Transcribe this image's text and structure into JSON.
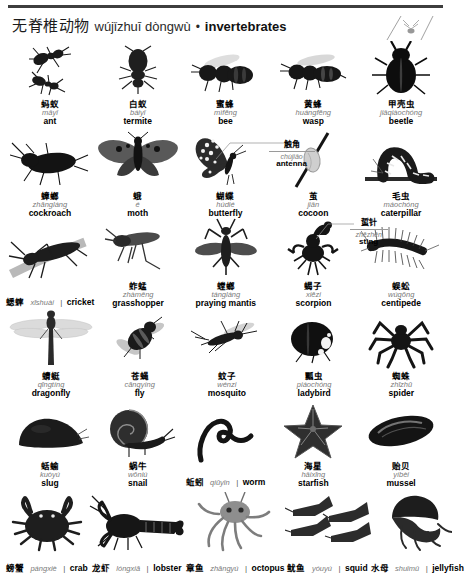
{
  "header": {
    "chinese": "无脊椎动物",
    "pinyin": "wújǐzhuī dòngwù",
    "separator": "•",
    "english": "invertebrates"
  },
  "rows": [
    {
      "row_index": 1,
      "items": [
        {
          "chinese": "蚂蚁",
          "pinyin": "mǎyǐ",
          "english": "ant",
          "layout": "stacked",
          "icon": "ant-icon"
        },
        {
          "chinese": "白蚁",
          "pinyin": "báiyǐ",
          "english": "termite",
          "layout": "stacked",
          "icon": "termite-icon"
        },
        {
          "chinese": "蜜蜂",
          "pinyin": "mìfēng",
          "english": "bee",
          "layout": "stacked",
          "icon": "bee-icon"
        },
        {
          "chinese": "黄蜂",
          "pinyin": "huángfēng",
          "english": "wasp",
          "layout": "stacked",
          "icon": "wasp-icon"
        },
        {
          "chinese": "甲壳虫",
          "pinyin": "jiǎqiàochóng",
          "english": "beetle",
          "layout": "stacked",
          "icon": "beetle-icon"
        }
      ]
    },
    {
      "row_index": 2,
      "items": [
        {
          "chinese": "蟑螂",
          "pinyin": "zhāngláng",
          "english": "cockroach",
          "layout": "stacked",
          "icon": "cockroach-icon"
        },
        {
          "chinese": "蛾",
          "pinyin": "é",
          "english": "moth",
          "layout": "stacked",
          "icon": "moth-icon"
        },
        {
          "chinese": "蝴蝶",
          "pinyin": "húdié",
          "english": "butterfly",
          "layout": "stacked",
          "icon": "butterfly-icon"
        },
        {
          "chinese": "茧",
          "pinyin": "jiǎn",
          "english": "cocoon",
          "layout": "stacked",
          "icon": "cocoon-icon"
        },
        {
          "chinese": "毛虫",
          "pinyin": "máochóng",
          "english": "caterpillar",
          "layout": "stacked",
          "icon": "caterpillar-icon"
        }
      ]
    },
    {
      "row_index": 3,
      "items": [
        {
          "chinese": "蟋蟀",
          "pinyin": "xīshuài",
          "english": "cricket",
          "layout": "inline",
          "icon": "cricket-icon"
        },
        {
          "chinese": "蚱蜢",
          "pinyin": "zhàměng",
          "english": "grasshopper",
          "layout": "stacked",
          "icon": "grasshopper-icon"
        },
        {
          "chinese": "螳螂",
          "pinyin": "tángláng",
          "english": "praying mantis",
          "layout": "stacked",
          "icon": "praying-mantis-icon"
        },
        {
          "chinese": "蝎子",
          "pinyin": "xiēzi",
          "english": "scorpion",
          "layout": "stacked",
          "icon": "scorpion-icon"
        },
        {
          "chinese": "蜈蚣",
          "pinyin": "wúgōng",
          "english": "centipede",
          "layout": "stacked",
          "icon": "centipede-icon"
        }
      ]
    },
    {
      "row_index": 4,
      "items": [
        {
          "chinese": "蜻蜓",
          "pinyin": "qīngtíng",
          "english": "dragonfly",
          "layout": "stacked",
          "icon": "dragonfly-icon"
        },
        {
          "chinese": "苍蝇",
          "pinyin": "cāngyíng",
          "english": "fly",
          "layout": "stacked",
          "icon": "fly-icon"
        },
        {
          "chinese": "蚊子",
          "pinyin": "wénzi",
          "english": "mosquito",
          "layout": "stacked",
          "icon": "mosquito-icon"
        },
        {
          "chinese": "瓢虫",
          "pinyin": "piáochóng",
          "english": "ladybird",
          "layout": "stacked",
          "icon": "ladybird-icon"
        },
        {
          "chinese": "蜘蛛",
          "pinyin": "zhīzhū",
          "english": "spider",
          "layout": "stacked",
          "icon": "spider-icon"
        }
      ]
    },
    {
      "row_index": 5,
      "items": [
        {
          "chinese": "蛞蝓",
          "pinyin": "kuòyú",
          "english": "slug",
          "layout": "stacked",
          "icon": "slug-icon"
        },
        {
          "chinese": "蜗牛",
          "pinyin": "wōniú",
          "english": "snail",
          "layout": "stacked",
          "icon": "snail-icon"
        },
        {
          "chinese": "蚯蚓",
          "pinyin": "qiūyǐn",
          "english": "worm",
          "layout": "inline",
          "icon": "worm-icon"
        },
        {
          "chinese": "海星",
          "pinyin": "hǎixīng",
          "english": "starfish",
          "layout": "stacked",
          "icon": "starfish-icon"
        },
        {
          "chinese": "贻贝",
          "pinyin": "yíbèi",
          "english": "mussel",
          "layout": "stacked",
          "icon": "mussel-icon"
        }
      ]
    },
    {
      "row_index": 6,
      "items": [
        {
          "chinese": "螃蟹",
          "pinyin": "pángxiè",
          "english": "crab",
          "layout": "inline",
          "icon": "crab-icon"
        },
        {
          "chinese": "龙虾",
          "pinyin": "lóngxiā",
          "english": "lobster",
          "layout": "inline",
          "icon": "lobster-icon"
        },
        {
          "chinese": "章鱼",
          "pinyin": "zhāngyú",
          "english": "octopus",
          "layout": "inline",
          "icon": "octopus-icon"
        },
        {
          "chinese": "鱿鱼",
          "pinyin": "yóuyú",
          "english": "squid",
          "layout": "inline",
          "icon": "squid-icon"
        },
        {
          "chinese": "水母",
          "pinyin": "shuǐmǔ",
          "english": "jellyfish",
          "layout": "inline",
          "icon": "jellyfish-icon"
        }
      ]
    }
  ],
  "callouts": [
    {
      "chinese": "触角",
      "pinyin": "chùjiǎo",
      "english": "antenna",
      "target": "butterfly"
    },
    {
      "chinese": "蜇针",
      "pinyin": "zhēzhēn",
      "english": "sting",
      "target": "scorpion"
    }
  ],
  "separator_glyph": "|",
  "colors": {
    "rule": "#3d3d3d",
    "chinese_text": "#000000",
    "pinyin_text": "#7a7a7a",
    "english_text": "#000000",
    "leader_line": "#8f8f8f",
    "background": "#ffffff"
  }
}
